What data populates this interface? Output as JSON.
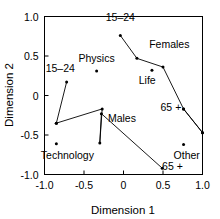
{
  "chart_data": {
    "type": "scatter",
    "title": "",
    "subtitle": "",
    "xlabel": "Dimension 1",
    "ylabel": "Dimension 2",
    "xlim": [
      -1.0,
      1.0
    ],
    "ylim": [
      -1.0,
      1.0
    ],
    "xticks": [
      -1.0,
      -0.5,
      0,
      0.5,
      1.0
    ],
    "yticks": [
      -1.0,
      -0.5,
      0,
      0.5,
      1.0
    ],
    "xtick_labels": [
      "-1.0",
      "-0.5",
      "0",
      "0.5",
      "1.0"
    ],
    "ytick_labels": [
      "-1.0",
      "-0.5",
      "0",
      "0.5",
      "1.0"
    ],
    "grid": false,
    "legend": "none",
    "marker_style": "filled-dot",
    "line_color": "#000000",
    "marker_color": "#000000",
    "series": [
      {
        "name": "Females",
        "connected": true,
        "points": [
          {
            "x": -0.04,
            "y": 0.76
          },
          {
            "x": 0.17,
            "y": 0.47
          },
          {
            "x": 0.5,
            "y": 0.36
          },
          {
            "x": 0.76,
            "y": -0.17
          },
          {
            "x": 1.0,
            "y": -0.47
          }
        ]
      },
      {
        "name": "Males",
        "connected": true,
        "points": [
          {
            "x": -0.85,
            "y": -0.35
          },
          {
            "x": -0.27,
            "y": -0.17
          },
          {
            "x": -0.3,
            "y": -0.6
          },
          {
            "x": -0.28,
            "y": -0.23
          },
          {
            "x": 0.49,
            "y": -0.92
          }
        ]
      },
      {
        "name": "Females-tail",
        "connected": true,
        "points": [
          {
            "x": 0.76,
            "y": -0.17
          },
          {
            "x": 1.0,
            "y": -0.47
          }
        ]
      },
      {
        "name": "Young-left",
        "connected": true,
        "points": [
          {
            "x": -0.72,
            "y": 0.17
          },
          {
            "x": -0.85,
            "y": -0.35
          }
        ]
      }
    ],
    "unconnected_points": [
      {
        "x": -0.34,
        "y": 0.31,
        "label": "Physics"
      },
      {
        "x": 0.36,
        "y": 0.32,
        "label": "Life"
      },
      {
        "x": -0.85,
        "y": -0.61,
        "label": "Technology"
      },
      {
        "x": 0.76,
        "y": -0.62,
        "label": "Other"
      }
    ],
    "annotations": [
      {
        "text": "15–24",
        "x": -0.04,
        "y": 0.76,
        "dx": 0,
        "dy": 14,
        "anchor": "middle"
      },
      {
        "text": "Females",
        "x": 0.58,
        "y": 0.6,
        "dx": 0,
        "dy": 0,
        "anchor": "middle"
      },
      {
        "text": "Physics",
        "x": -0.34,
        "y": 0.43,
        "dx": 0,
        "dy": 0,
        "anchor": "middle"
      },
      {
        "text": "Life",
        "x": 0.3,
        "y": 0.15,
        "dx": 0,
        "dy": 0,
        "anchor": "middle"
      },
      {
        "text": "15–24",
        "x": -0.8,
        "y": 0.3,
        "dx": 0,
        "dy": 0,
        "anchor": "middle"
      },
      {
        "text": "Males",
        "x": -0.02,
        "y": -0.33,
        "dx": 0,
        "dy": 0,
        "anchor": "middle"
      },
      {
        "text": "65 +",
        "x": 0.6,
        "y": -0.19,
        "dx": 0,
        "dy": 0,
        "anchor": "middle"
      },
      {
        "text": "Technology",
        "x": -0.71,
        "y": -0.8,
        "dx": 0,
        "dy": 0,
        "anchor": "middle"
      },
      {
        "text": "Other",
        "x": 0.8,
        "y": -0.8,
        "dx": 0,
        "dy": 0,
        "anchor": "middle"
      },
      {
        "text": "65 +",
        "x": 0.62,
        "y": -0.94,
        "dx": 0,
        "dy": 0,
        "anchor": "middle"
      }
    ]
  },
  "axes": {
    "xlabel": "Dimension 1",
    "ylabel": "Dimension 2"
  }
}
